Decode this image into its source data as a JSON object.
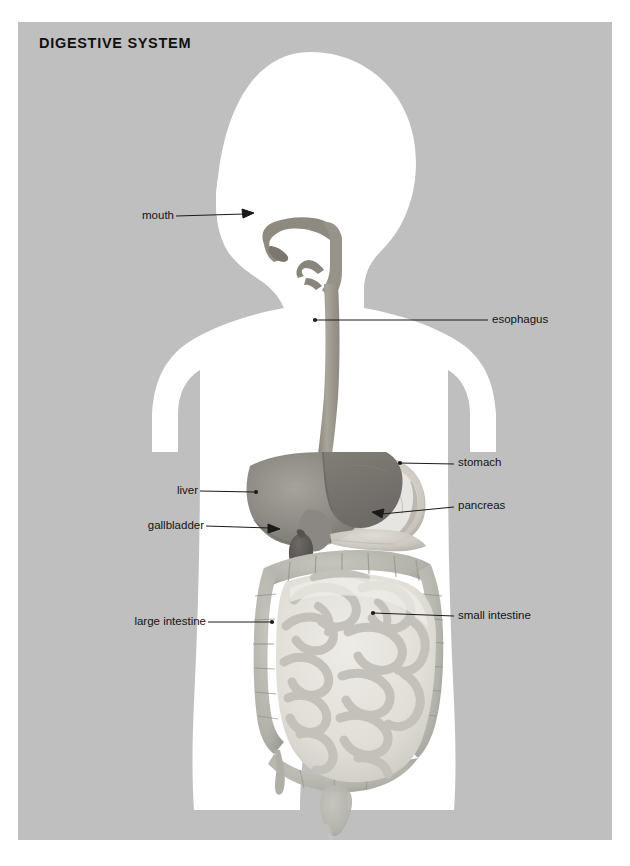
{
  "title": "DIGESTIVE SYSTEM",
  "panel": {
    "background_color": "#bfbfbf",
    "body_color": "#ffffff"
  },
  "diagram": {
    "type": "anatomical-illustration",
    "view": "anterior body silhouette with head in left profile",
    "labels": [
      {
        "id": "mouth",
        "text": "mouth",
        "side": "left",
        "x": 138,
        "y": 216,
        "line_x1": 176,
        "line_y1": 216,
        "line_x2": 244,
        "line_y2": 213,
        "marker": "arrow"
      },
      {
        "id": "esophagus",
        "text": "esophagus",
        "side": "right",
        "x": 494,
        "y": 320,
        "line_x1": 315,
        "line_y1": 320,
        "line_x2": 488,
        "line_y2": 320,
        "marker": "dot"
      },
      {
        "id": "stomach",
        "text": "stomach",
        "side": "right",
        "x": 460,
        "y": 464,
        "line_x1": 400,
        "line_y1": 463,
        "line_x2": 454,
        "line_y2": 464,
        "marker": "dot"
      },
      {
        "id": "pancreas",
        "text": "pancreas",
        "side": "right",
        "x": 460,
        "y": 507,
        "line_x1": 372,
        "line_y1": 512,
        "line_x2": 454,
        "line_y2": 507,
        "marker": "arrow"
      },
      {
        "id": "liver",
        "text": "liver",
        "side": "left",
        "x": 195,
        "y": 491,
        "line_x1": 200,
        "line_y1": 491,
        "line_x2": 256,
        "line_y2": 492,
        "marker": "dot"
      },
      {
        "id": "gallbladder",
        "text": "gallbladder",
        "side": "left",
        "x": 202,
        "y": 526,
        "line_x1": 206,
        "line_y1": 526,
        "line_x2": 279,
        "line_y2": 528,
        "marker": "arrow"
      },
      {
        "id": "large-intestine",
        "text": "large intestine",
        "side": "left",
        "x": 204,
        "y": 622,
        "line_x1": 208,
        "line_y1": 622,
        "line_x2": 272,
        "line_y2": 622,
        "marker": "dot"
      },
      {
        "id": "small-intestine",
        "text": "small intestine",
        "side": "right",
        "x": 460,
        "y": 616,
        "line_x1": 373,
        "line_y1": 613,
        "line_x2": 454,
        "line_y2": 616,
        "marker": "dot"
      }
    ],
    "organs": [
      {
        "id": "oral-cavity",
        "name": "mouth and pharynx",
        "tone": "#8f8a80"
      },
      {
        "id": "esophagus-tube",
        "name": "esophagus",
        "tone": "#9b968c"
      },
      {
        "id": "liver-mass",
        "name": "liver",
        "tone": "#8e8b87"
      },
      {
        "id": "gallbladder-sac",
        "name": "gallbladder",
        "tone": "#5d5a57"
      },
      {
        "id": "stomach-sac",
        "name": "stomach",
        "tone": "#cfcbc3"
      },
      {
        "id": "pancreas-gland",
        "name": "pancreas",
        "tone": "#c6c2ba"
      },
      {
        "id": "large-bowel",
        "name": "large intestine",
        "tone": "#b6b6ae"
      },
      {
        "id": "small-bowel",
        "name": "small intestine",
        "tone": "#e2e0d9"
      },
      {
        "id": "rectum-tube",
        "name": "rectum",
        "tone": "#c9c7c0"
      }
    ]
  }
}
